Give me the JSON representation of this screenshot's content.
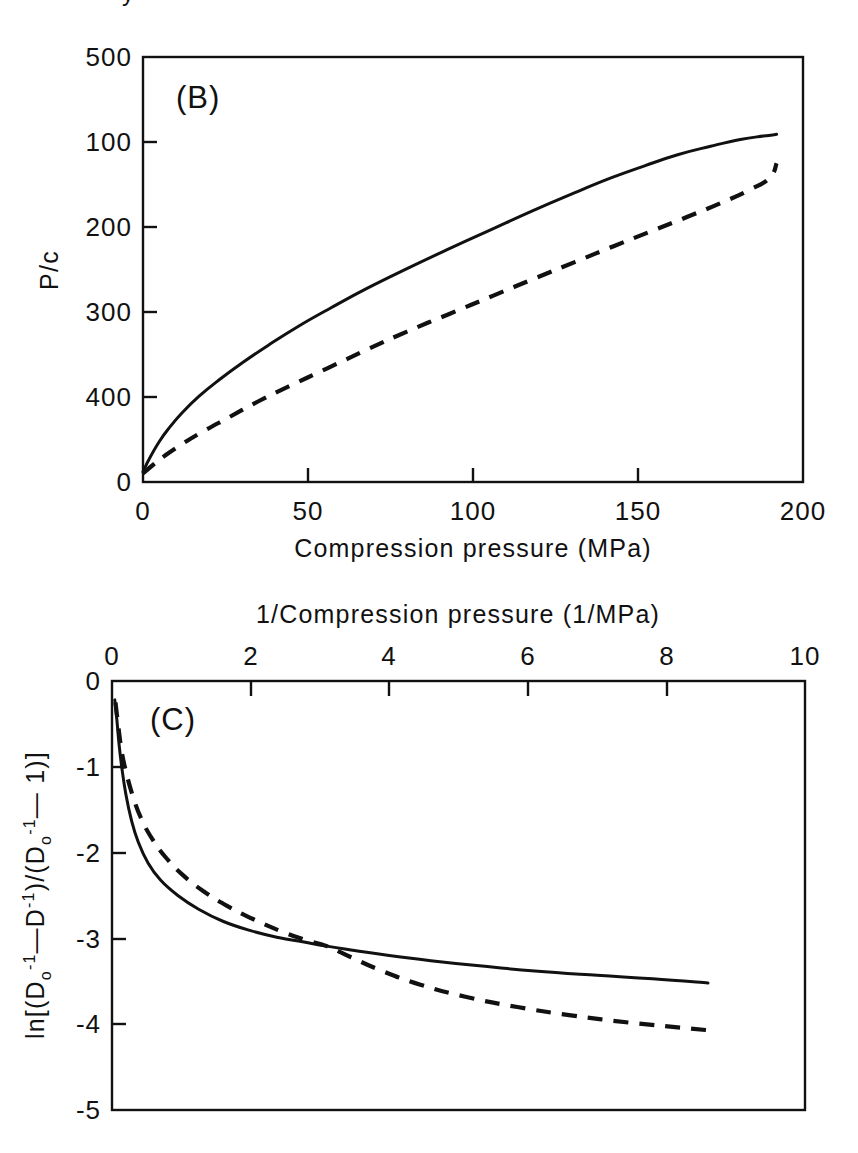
{
  "figure": {
    "background": "#ffffff",
    "ink_color": "#111111",
    "cropped_fragment_top": "y"
  },
  "chart_data": [
    {
      "id": "panel-b",
      "type": "line",
      "panel_label": "(B)",
      "title": "",
      "xlabel": "Compression pressure (MPa)",
      "ylabel": "P/c",
      "xlim": [
        0,
        200
      ],
      "ylim": [
        0,
        500
      ],
      "xticks": [
        0,
        50,
        100,
        150,
        200
      ],
      "yticks": [
        0,
        100,
        200,
        300,
        400,
        500
      ],
      "xtick_labels": [
        "0",
        "50",
        "100",
        "150",
        "200"
      ],
      "ytick_labels": [
        "0",
        "100",
        "200",
        "300",
        "400",
        "500"
      ],
      "grid": false,
      "legend": "none",
      "xaxis_position": "bottom",
      "series": [
        {
          "name": "solid-curve",
          "style": "solid",
          "x": [
            0,
            2,
            5,
            8,
            12,
            17,
            23,
            30,
            38,
            47,
            57,
            68,
            80,
            92,
            105,
            118,
            130,
            142,
            152,
            162,
            172,
            181,
            188,
            192
          ],
          "y": [
            12,
            28,
            48,
            64,
            82,
            101,
            120,
            140,
            161,
            183,
            205,
            228,
            251,
            273,
            296,
            319,
            339,
            358,
            372,
            385,
            395,
            403,
            407,
            409
          ]
        },
        {
          "name": "dashed-curve",
          "style": "dashed",
          "x": [
            0,
            3,
            7,
            12,
            18,
            26,
            35,
            45,
            56,
            68,
            80,
            93,
            106,
            119,
            131,
            143,
            154,
            165,
            175,
            184,
            190,
            192
          ],
          "y": [
            10,
            20,
            32,
            45,
            59,
            76,
            95,
            114,
            134,
            156,
            177,
            198,
            219,
            240,
            259,
            278,
            295,
            312,
            328,
            344,
            358,
            375
          ]
        }
      ]
    },
    {
      "id": "panel-c",
      "type": "line",
      "panel_label": "(C)",
      "title": "",
      "xlabel": "1/Compression pressure (1/MPa)",
      "ylabel": "ln[(Do^-1 - D^-1)/(Do^-1 - 1)]",
      "ylabel_parts": {
        "prefix": "ln[(D",
        "sub1": "o",
        "sup1": "-1",
        "mid1": "—D",
        "sup2": "-1",
        "mid2": ")/(D",
        "sub2": "o",
        "sup3": "-1",
        "mid3": "— 1)]"
      },
      "xlim": [
        0,
        10
      ],
      "ylim": [
        -5,
        0
      ],
      "xticks": [
        0,
        2,
        4,
        6,
        8,
        10
      ],
      "yticks": [
        0,
        -1,
        -2,
        -3,
        -4,
        -5
      ],
      "xtick_labels": [
        "0",
        "2",
        "4",
        "6",
        "8",
        "10"
      ],
      "ytick_labels": [
        "0",
        "-1",
        "-2",
        "-3",
        "-4",
        "-5"
      ],
      "grid": false,
      "legend": "none",
      "xaxis_position": "top",
      "series": [
        {
          "name": "solid-curve",
          "style": "solid",
          "x": [
            0.04,
            0.07,
            0.1,
            0.14,
            0.2,
            0.28,
            0.38,
            0.52,
            0.7,
            0.95,
            1.25,
            1.6,
            2.0,
            2.4,
            2.75,
            3.1,
            3.5,
            4.0,
            4.6,
            5.3,
            6.1,
            7.0,
            7.8,
            8.6
          ],
          "y": [
            -0.22,
            -0.45,
            -0.72,
            -1.0,
            -1.32,
            -1.62,
            -1.88,
            -2.12,
            -2.32,
            -2.5,
            -2.66,
            -2.8,
            -2.91,
            -2.99,
            -3.04,
            -3.09,
            -3.14,
            -3.2,
            -3.26,
            -3.32,
            -3.38,
            -3.43,
            -3.47,
            -3.52
          ]
        },
        {
          "name": "dashed-curve",
          "style": "dashed",
          "x": [
            0.05,
            0.09,
            0.14,
            0.2,
            0.3,
            0.42,
            0.58,
            0.78,
            1.02,
            1.32,
            1.66,
            2.05,
            2.45,
            2.8,
            3.1,
            3.45,
            3.9,
            4.45,
            5.1,
            5.85,
            6.65,
            7.45,
            8.2,
            8.6
          ],
          "y": [
            -0.25,
            -0.52,
            -0.82,
            -1.05,
            -1.34,
            -1.6,
            -1.84,
            -2.06,
            -2.26,
            -2.45,
            -2.62,
            -2.78,
            -2.92,
            -3.02,
            -3.09,
            -3.22,
            -3.38,
            -3.54,
            -3.68,
            -3.8,
            -3.9,
            -3.98,
            -4.04,
            -4.07
          ]
        }
      ]
    }
  ]
}
